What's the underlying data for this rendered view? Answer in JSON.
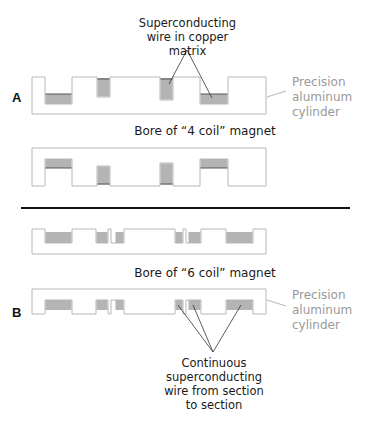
{
  "colors": {
    "outline": "#b8b8b8",
    "wire_fill": "#b4b4b4",
    "wire_edge": "#555555",
    "leader": "#333333",
    "divider": "#111111",
    "side_label": "#9a9a9a"
  },
  "panel_a": {
    "label": "A",
    "callout_top": [
      "Superconducting",
      "wire in copper matrix"
    ],
    "side_label": [
      "Precision",
      "aluminum",
      "cylinder"
    ],
    "bore_caption": "Bore of “4 coil” magnet"
  },
  "panel_b": {
    "label": "B",
    "bore_caption": "Bore of “6 coil” magnet",
    "side_label": [
      "Precision",
      "aluminum",
      "cylinder"
    ],
    "callout_bottom": [
      "Continuous",
      "superconducting",
      "wire from section",
      "to section"
    ]
  }
}
